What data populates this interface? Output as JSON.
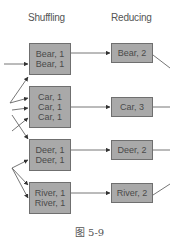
{
  "diagram": {
    "stages": {
      "shuffling": "Shuffling",
      "reducing": "Reducing"
    },
    "shuffle_groups": [
      {
        "key": "bear",
        "lines": [
          "Bear, 1",
          "Bear, 1"
        ]
      },
      {
        "key": "car",
        "lines": [
          "Car, 1",
          "Car, 1",
          "Car, 1"
        ]
      },
      {
        "key": "deer",
        "lines": [
          "Deer, 1",
          "Deer, 1"
        ]
      },
      {
        "key": "river",
        "lines": [
          "River, 1",
          "River, 1"
        ]
      }
    ],
    "reduce_results": [
      {
        "key": "bear",
        "label": "Bear, 2"
      },
      {
        "key": "car",
        "label": "Car, 3"
      },
      {
        "key": "deer",
        "label": "Deer, 2"
      },
      {
        "key": "river",
        "label": "River, 2"
      }
    ],
    "colors": {
      "box_fill": "#a9a9a9",
      "box_border": "#6f6f6f",
      "line": "#555555"
    },
    "caption": "图 5-9"
  }
}
